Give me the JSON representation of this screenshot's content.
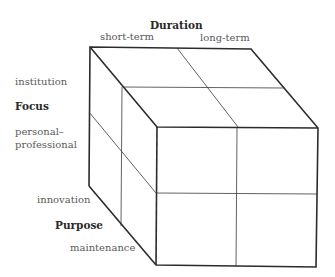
{
  "diagram": {
    "type": "3d-cube-matrix",
    "axes": {
      "duration": {
        "title": "Duration",
        "values": [
          "short-term",
          "long-term"
        ]
      },
      "focus": {
        "title": "Focus",
        "values": [
          "institution",
          "personal–",
          "professional"
        ]
      },
      "purpose": {
        "title": "Purpose",
        "values": [
          "innovation",
          "maintenance"
        ]
      }
    },
    "colors": {
      "line": "#2b2b2b",
      "text": "#5a5a5a",
      "title": "#2a2a2a"
    }
  }
}
